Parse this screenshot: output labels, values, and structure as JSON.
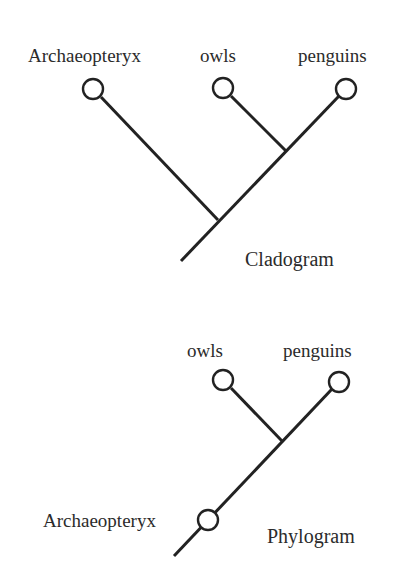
{
  "cladogram": {
    "title": "Cladogram",
    "taxa": [
      {
        "name": "Archaeopteryx",
        "cx": 93,
        "cy": 89
      },
      {
        "name": "owls",
        "cx": 223,
        "cy": 88
      },
      {
        "name": "penguins",
        "cx": 346,
        "cy": 89
      }
    ],
    "nodes": {
      "root_end": {
        "x": 181,
        "y": 261
      },
      "outer_node": {
        "x": 218,
        "y": 220
      },
      "inner_node": {
        "x": 286,
        "y": 151
      }
    }
  },
  "phylogram": {
    "title": "Phylogram",
    "taxa": [
      {
        "name": "owls",
        "cx": 223,
        "cy": 380
      },
      {
        "name": "penguins",
        "cx": 339,
        "cy": 382
      },
      {
        "name": "Archaeopteryx",
        "cx": 208,
        "cy": 520
      }
    ],
    "nodes": {
      "root_end": {
        "x": 174,
        "y": 556
      },
      "inner_node": {
        "x": 282,
        "y": 441
      }
    }
  },
  "style": {
    "stroke_color": "#222222",
    "background": "#ffffff",
    "circle_radius": 10
  }
}
